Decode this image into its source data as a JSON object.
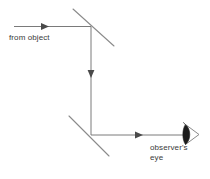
{
  "figure": {
    "type": "optics-ray-diagram",
    "background_color": "#ffffff",
    "line_color": "#6e6e6e",
    "text_color": "#3a3a3a"
  },
  "labels": {
    "from_object": "from object",
    "observer_line1": "observer's",
    "observer_line2": "eye",
    "caption_fragment": ""
  },
  "elements": {
    "incoming_ray_name": "incoming light ray from object",
    "vertical_ray_name": "vertical light ray between mirrors",
    "outgoing_ray_name": "outgoing light ray to observer",
    "top_mirror_name": "upper angled mirror",
    "bottom_mirror_name": "lower angled mirror",
    "eye_name": "observer eye symbol"
  },
  "geometry": {
    "incoming_ray": {
      "x1": 14,
      "y1": 26.5,
      "x2": 91,
      "y2": 26.5,
      "arrow_at": 48
    },
    "vertical_ray": {
      "x1": 91,
      "y1": 26.5,
      "x2": 91,
      "y2": 135,
      "arrow_at": 77
    },
    "outgoing_ray": {
      "x1": 91,
      "y1": 135,
      "x2": 185,
      "y2": 135,
      "arrow_at": 142
    },
    "top_mirror": {
      "x1": 73,
      "y1": 9,
      "x2": 114,
      "y2": 46
    },
    "bottom_mirror": {
      "x1": 69,
      "y1": 116,
      "x2": 109,
      "y2": 156
    },
    "eye": {
      "cx": 190,
      "cy": 134,
      "size": 13
    },
    "mirror_angle_deg": 45
  }
}
